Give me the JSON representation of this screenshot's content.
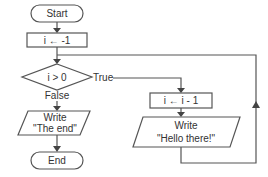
{
  "flowchart": {
    "nodes": {
      "start": {
        "label": "Start",
        "type": "terminator"
      },
      "init": {
        "label": "i ← -1",
        "type": "process"
      },
      "condition": {
        "label": "i > 0",
        "type": "decision"
      },
      "decrement": {
        "label": "i ← i - 1",
        "type": "process"
      },
      "write_hello": {
        "line1": "Write",
        "line2": "\"Hello there!\"",
        "type": "io"
      },
      "write_end": {
        "line1": "Write",
        "line2": "\"The end\"",
        "type": "io"
      },
      "end": {
        "label": "End",
        "type": "terminator"
      }
    },
    "edges": {
      "true_label": "True",
      "false_label": "False"
    },
    "colors": {
      "stroke": "#555555",
      "fill": "#ffffff",
      "text": "#333333"
    }
  }
}
